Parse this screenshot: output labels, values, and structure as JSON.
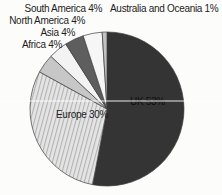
{
  "chart_data": {
    "type": "pie",
    "title": "",
    "unit": "%",
    "direction": "clockwise",
    "start_angle_deg": 0,
    "slices": [
      {
        "name": "UK",
        "value": 53,
        "label": "UK 53%",
        "color": "#343434",
        "pattern": "solid"
      },
      {
        "name": "Europe",
        "value": 30,
        "label": "Europe 30%",
        "color": "#d9d9d9",
        "pattern": "hatch"
      },
      {
        "name": "Africa",
        "value": 4,
        "label": "Africa 4%",
        "color": "#c7c7c7",
        "pattern": "solid"
      },
      {
        "name": "Asia",
        "value": 4,
        "label": "Asia 4%",
        "color": "#f3f3f3",
        "pattern": "solid"
      },
      {
        "name": "North America",
        "value": 4,
        "label": "North America 4%",
        "color": "#5e5e5e",
        "pattern": "solid"
      },
      {
        "name": "South America",
        "value": 4,
        "label": "South America 4%",
        "color": "#f6f6f6",
        "pattern": "solid"
      },
      {
        "name": "Australia and Oceania",
        "value": 1,
        "label": "Australia and Oceania 1%",
        "color": "#c2c2c2",
        "pattern": "solid"
      }
    ],
    "geometry": {
      "cx": 107,
      "cy": 109,
      "r": 77
    },
    "hatch": {
      "base": "#e4e4e4",
      "stripe": "#b2b2b2",
      "angle_deg": 15
    },
    "outline_color": "#3c3c3c",
    "label_color": "#1c1c1c",
    "uk_label_color": "#0d0d0d",
    "background": "#fcfcfb",
    "legend_position": "labels-around"
  }
}
